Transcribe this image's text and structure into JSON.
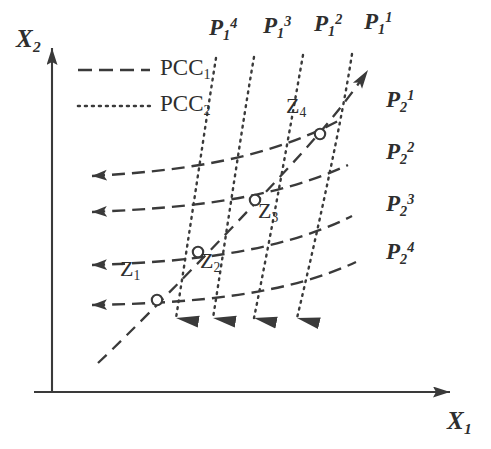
{
  "figure": {
    "type": "economics-price-consumption-curve-diagram",
    "background_color": "#ffffff",
    "ink_color": "#3a3a3a"
  },
  "axes": {
    "y_axis": {
      "name": "X2",
      "base": "X",
      "sub": "2",
      "sup": ""
    },
    "x_axis": {
      "name": "X1",
      "base": "X",
      "sub": "1",
      "sup": ""
    },
    "origin": {
      "x": 52,
      "y": 392
    },
    "y_top": 35,
    "x_right": 467
  },
  "legend": {
    "items": [
      {
        "key": "pcc1",
        "base": "PCC",
        "sub": "1",
        "style": "dashed",
        "line_x1": 78,
        "line_x2": 150,
        "line_y": 70,
        "label_x": 160,
        "label_y": 58
      },
      {
        "key": "pcc2",
        "base": "PCC",
        "sub": "2",
        "style": "dotted",
        "line_x1": 78,
        "line_x2": 150,
        "line_y": 106,
        "label_x": 160,
        "label_y": 94
      }
    ]
  },
  "chart_data": {
    "type": "line",
    "title": "",
    "xlabel": "X1",
    "ylabel": "X2",
    "grid": false,
    "legend_position": "top-left",
    "series": [
      {
        "name": "P1^4",
        "label": {
          "base": "P",
          "sub": "1",
          "sup": "4"
        },
        "style": "dotted",
        "role": "price-consumption-curve-2",
        "label_x": 209,
        "label_y": 16,
        "path": "M 216,58 C 206,120 190,230 176,318",
        "arrow_at": {
          "x": 172,
          "y": 330,
          "dir": "down"
        }
      },
      {
        "name": "P1^3",
        "label": {
          "base": "P",
          "sub": "1",
          "sup": "3"
        },
        "style": "dotted",
        "role": "price-consumption-curve-2",
        "label_x": 263,
        "label_y": 14,
        "path": "M 254,57 C 243,120 227,230 213,318",
        "arrow_at": {
          "x": 209,
          "y": 330,
          "dir": "down"
        }
      },
      {
        "name": "P1^2",
        "label": {
          "base": "P",
          "sub": "1",
          "sup": "2"
        },
        "style": "dotted",
        "role": "price-consumption-curve-2",
        "label_x": 314,
        "label_y": 12,
        "path": "M 303,55 C 292,118 272,230 254,318",
        "arrow_at": {
          "x": 250,
          "y": 330,
          "dir": "down"
        }
      },
      {
        "name": "P1^1",
        "label": {
          "base": "P",
          "sub": "1",
          "sup": "1"
        },
        "style": "dotted",
        "role": "price-consumption-curve-2",
        "label_x": 364,
        "label_y": 10,
        "path": "M 352,54 C 342,120 318,230 297,318",
        "arrow_at": {
          "x": 293,
          "y": 330,
          "dir": "down"
        }
      },
      {
        "name": "P2^1",
        "label": {
          "base": "P",
          "sub": "2",
          "sup": "1"
        },
        "style": "dashed",
        "role": "price-consumption-curve-1",
        "label_x": 386,
        "label_y": 88,
        "path": "M 92,176 C 180,171 265,160 340,120",
        "arrow_at": {
          "x": 88,
          "y": 176,
          "dir": "left"
        }
      },
      {
        "name": "P2^2",
        "label": {
          "base": "P",
          "sub": "2",
          "sup": "2"
        },
        "style": "dashed",
        "role": "price-consumption-curve-1",
        "label_x": 386,
        "label_y": 140,
        "path": "M 92,212 C 185,208 272,200 348,165",
        "arrow_at": {
          "x": 88,
          "y": 212,
          "dir": "left"
        }
      },
      {
        "name": "P2^3",
        "label": {
          "base": "P",
          "sub": "2",
          "sup": "3"
        },
        "style": "dashed",
        "role": "price-consumption-curve-1",
        "label_x": 386,
        "label_y": 192,
        "path": "M 92,265 C 190,262 280,252 352,216",
        "arrow_at": {
          "x": 88,
          "y": 265,
          "dir": "left"
        }
      },
      {
        "name": "P2^4",
        "label": {
          "base": "P",
          "sub": "2",
          "sup": "4"
        },
        "style": "dashed",
        "role": "price-consumption-curve-1",
        "label_x": 386,
        "label_y": 240,
        "path": "M 92,305 C 195,303 285,295 356,262",
        "arrow_at": {
          "x": 88,
          "y": 305,
          "dir": "left"
        }
      }
    ],
    "expansion_path": {
      "name": "expansion-path",
      "style": "dashed",
      "path": "M 98,363 C 130,333 200,262 260,198 C 300,156 340,112 368,70",
      "arrow_at": {
        "x": 372,
        "y": 64,
        "dir": "up-right"
      }
    },
    "points": [
      {
        "name": "Z1",
        "base": "Z",
        "sub": "1",
        "x": 157,
        "y": 300,
        "label_x": 120,
        "label_y": 258
      },
      {
        "name": "Z2",
        "base": "Z",
        "sub": "2",
        "x": 198,
        "y": 252,
        "label_x": 200,
        "label_y": 250
      },
      {
        "name": "Z3",
        "base": "Z",
        "sub": "3",
        "x": 255,
        "y": 200,
        "label_x": 258,
        "label_y": 200
      },
      {
        "name": "Z4",
        "base": "Z",
        "sub": "4",
        "x": 320,
        "y": 134,
        "label_x": 286,
        "label_y": 95
      }
    ]
  }
}
